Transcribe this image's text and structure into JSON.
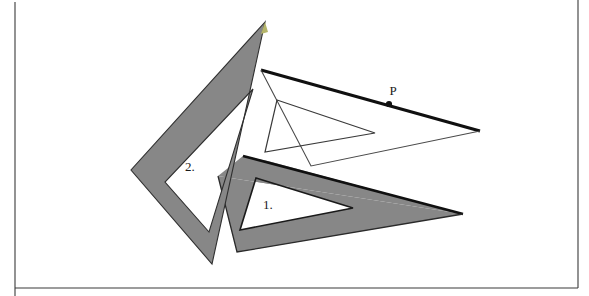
{
  "page": {
    "background_color": "#ffffff",
    "width": 589,
    "height": 296,
    "frame_color": "#3a3a3a"
  },
  "figure": {
    "shaded_fill": "#878787",
    "unshaded_fill": "#ffffff",
    "outline_color": "#1a1a1a",
    "thin_outline_color": "#555555",
    "highlight_color": "#b5b56a"
  },
  "labels": {
    "triangle_one": "1.",
    "triangle_two": "2.",
    "point_p": "P"
  },
  "annotations": {
    "point_p_marker": "filled-dot",
    "point_p_x": 389,
    "point_p_y": 104,
    "label_one_x": 263,
    "label_one_y": 209,
    "label_two_x": 185,
    "label_two_y": 171,
    "label_p_x": 393,
    "label_p_y": 95
  },
  "shapes": {
    "triangle_two_shaded": {
      "name": "triangle-2-shaded-frame",
      "outer": "265,22 131,170 212,264",
      "inner": "253,89 165,182 209,232",
      "fill": "#878787"
    },
    "triangle_one_shaded": {
      "name": "triangle-1-shaded-frame",
      "outer": "218,176 463,214 237,252",
      "inner": "256,178 353,208 240,230",
      "fill": "#878787"
    },
    "triangle_one_upper_band": {
      "name": "triangle-1-upper-band",
      "points": "218,176 463,214 275,160 249,154",
      "fill": "#878787"
    },
    "triangle_three_white": {
      "name": "triangle-3-white-frame",
      "outer": "261,70 480,131 311,166",
      "inner": "277,100 375,133 265,152",
      "fill": "#ffffff"
    }
  },
  "frame": {
    "left_rule_x": 15,
    "right_rule_x": 578,
    "bottom_rule_y": 288
  }
}
